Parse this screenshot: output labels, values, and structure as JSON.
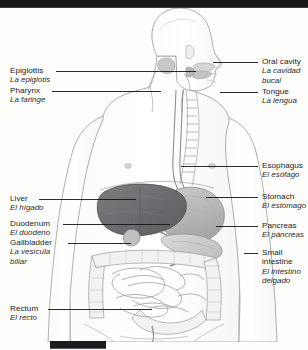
{
  "figure": {
    "languages": [
      "English",
      "Spanish"
    ],
    "colors": {
      "liver": "#6f6f72",
      "stomach": "#bdbdbd",
      "pancreas": "#cfcfcf",
      "intestine": "#e6e6e6",
      "outline": "#8a8a8a",
      "leader_line": "#1a1a1a",
      "text": "#191919",
      "bar": "#17181a",
      "background": "#fdfdfc"
    }
  },
  "labels_left": [
    {
      "en": "Epiglottis",
      "es": "La epiglotis"
    },
    {
      "en": "Pharynx",
      "es": "La faringe"
    },
    {
      "en": "Liver",
      "es": "El hígado"
    },
    {
      "en": "Duodenum",
      "es": "El duodeno"
    },
    {
      "en": "Gallbladder",
      "es": "La vesícula biliar"
    },
    {
      "en": "Rectum",
      "es": "El recto"
    }
  ],
  "labels_right": [
    {
      "en": "Oral cavity",
      "es": "La cavidad bucal"
    },
    {
      "en": "Tongue",
      "es": "La lengua"
    },
    {
      "en": "Esophagus",
      "es": "El esófago"
    },
    {
      "en": "Stomach",
      "es": "El estómago"
    },
    {
      "en": "Pancreas",
      "es": "El páncreas"
    },
    {
      "en": "Small intestine",
      "es": "El intestino delgado"
    }
  ],
  "label_lines": {
    "gallbladder_es_line1": "La vesícula",
    "gallbladder_es_line2": "biliar",
    "small_intestine_en_line1": "Small",
    "small_intestine_en_line2": "intestine",
    "small_intestine_es_line1": "El intestino",
    "small_intestine_es_line2": "delgado",
    "oral_cavity_es_line1": "La cavidad",
    "oral_cavity_es_line2": "bucal"
  }
}
